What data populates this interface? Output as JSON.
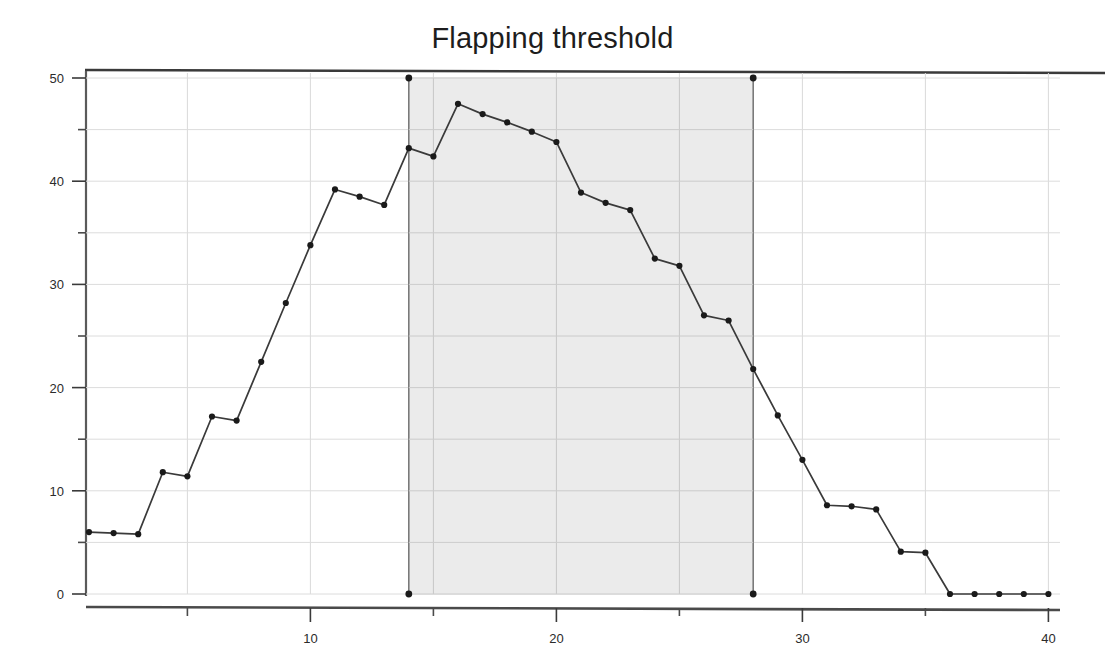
{
  "chart_data": {
    "type": "line",
    "title": "Flapping threshold",
    "xlabel": "",
    "ylabel": "",
    "xlim": [
      0.4,
      40.4
    ],
    "ylim": [
      0,
      50
    ],
    "grid": true,
    "grid_step_x": 5,
    "grid_step_y": 5,
    "legend": "none",
    "x_ticks_major": [
      10,
      20,
      30,
      40
    ],
    "x_ticks_minor": [
      5,
      15,
      25,
      35
    ],
    "x_tick_labels": [
      "10",
      "20",
      "30",
      "40"
    ],
    "y_ticks_major": [
      0,
      10,
      20,
      30,
      40,
      50
    ],
    "y_ticks_minor": [
      5,
      15,
      25,
      35,
      45
    ],
    "y_tick_labels": [
      "0",
      "10",
      "20",
      "30",
      "40",
      "50"
    ],
    "marker": "circle",
    "marker_color": "#1a1a1a",
    "line_color": "#3a3a3a",
    "x": [
      1,
      2,
      3,
      4,
      5,
      6,
      7,
      8,
      9,
      10,
      11,
      12,
      13,
      14,
      15,
      16,
      17,
      18,
      19,
      20,
      21,
      22,
      23,
      24,
      25,
      26,
      27,
      28,
      29,
      30,
      31,
      32,
      33,
      34,
      35,
      36,
      37,
      38,
      39,
      40
    ],
    "values": [
      6.0,
      5.9,
      5.8,
      11.8,
      11.4,
      17.2,
      16.8,
      22.5,
      28.2,
      33.8,
      39.2,
      38.5,
      37.7,
      43.2,
      42.4,
      47.5,
      46.5,
      45.7,
      44.8,
      43.8,
      38.9,
      37.9,
      37.2,
      32.5,
      31.8,
      27.0,
      26.5,
      21.8,
      17.3,
      13.0,
      8.6,
      8.5,
      8.2,
      4.1,
      4.0,
      0.0,
      0.0,
      0.0,
      0.0,
      0.0
    ],
    "annotations": [
      {
        "name": "highlight-band",
        "type": "vspan",
        "x_start": 14,
        "x_end": 28,
        "y_start": 0,
        "y_end": 50,
        "fill": "#e8e8e8",
        "edge": "#7a7a7a",
        "corner_markers": [
          {
            "x": 14,
            "y": 50
          },
          {
            "x": 28,
            "y": 50
          },
          {
            "x": 14,
            "y": 0
          },
          {
            "x": 28,
            "y": 0
          }
        ]
      }
    ]
  }
}
